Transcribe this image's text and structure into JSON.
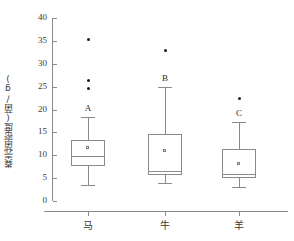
{
  "chart_data": {
    "type": "box",
    "title": "",
    "xlabel": "",
    "ylabel": "粪壳菌密度(菌/g)",
    "ylim": [
      0,
      40
    ],
    "yticks": [
      0,
      5,
      10,
      15,
      20,
      25,
      30,
      35,
      40
    ],
    "ytick_labels": [
      "0",
      "5",
      "10",
      "15",
      "20",
      "25",
      "30",
      "35",
      "40"
    ],
    "grid": false,
    "legend": "none",
    "categories": [
      "马",
      "牛",
      "羊"
    ],
    "group_letters": [
      "A",
      "B",
      "C"
    ],
    "boxes": [
      {
        "category": "马",
        "letter": "A",
        "whisker_low": 3.5,
        "q1": 7.6,
        "median": 9.8,
        "q3": 13.4,
        "whisker_high": 18.4,
        "mean": 11.6,
        "outliers": [
          24.5,
          26.4,
          35.4
        ]
      },
      {
        "category": "牛",
        "letter": "B",
        "whisker_low": 4.0,
        "q1": 5.7,
        "median": 6.6,
        "q3": 14.6,
        "whisker_high": 25.0,
        "mean": 11.0,
        "outliers": [
          33.0
        ]
      },
      {
        "category": "羊",
        "letter": "C",
        "whisker_low": 3.0,
        "q1": 5.0,
        "median": 6.0,
        "q3": 11.4,
        "whisker_high": 17.2,
        "mean": 8.0,
        "outliers": [
          22.4
        ]
      }
    ],
    "colors": {
      "axis": "#8a8a8a",
      "box_stroke": "#8a8a8a",
      "outlier": "#1a1a1a",
      "mean_fill": "#ffffff",
      "text": "#3a3a3a",
      "background": "#ffffff"
    }
  }
}
